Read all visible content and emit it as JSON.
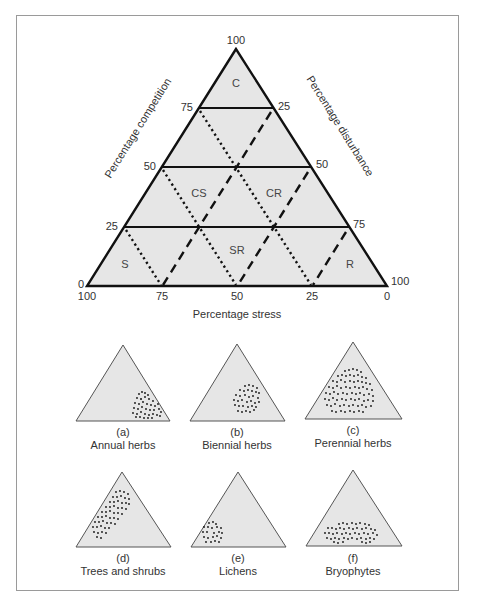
{
  "main_diagram": {
    "title": "CSR triangle",
    "fill_color": "#e6e6e6",
    "line_color": "#111111",
    "axes": {
      "competition": "Percentage competition",
      "disturbance": "Percentage disturbance",
      "stress": "Percentage stress"
    },
    "ticks": {
      "apex": "100",
      "competition": [
        "75",
        "50",
        "25",
        "0"
      ],
      "disturbance": [
        "25",
        "50",
        "75",
        "100"
      ],
      "stress": [
        "100",
        "75",
        "50",
        "25",
        "0"
      ]
    },
    "zones": {
      "C": "C",
      "CS": "CS",
      "CR": "CR",
      "S": "S",
      "SR": "SR",
      "R": "R"
    }
  },
  "panels": [
    {
      "letter": "(a)",
      "label": "Annual herbs"
    },
    {
      "letter": "(b)",
      "label": "Biennial herbs"
    },
    {
      "letter": "(c)",
      "label": "Perennial herbs"
    },
    {
      "letter": "(d)",
      "label": "Trees and shrubs"
    },
    {
      "letter": "(e)",
      "label": "Lichens"
    },
    {
      "letter": "(f)",
      "label": "Bryophytes"
    }
  ]
}
